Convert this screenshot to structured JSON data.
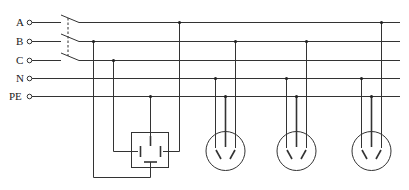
{
  "diagram": {
    "lines": [
      {
        "label": "A",
        "y": 22
      },
      {
        "label": "B",
        "y": 41
      },
      {
        "label": "C",
        "y": 60
      },
      {
        "label": "N",
        "y": 78
      },
      {
        "label": "PE",
        "y": 96
      }
    ],
    "colors": {
      "line": "#333333",
      "background": "#ffffff"
    },
    "components": {
      "switch": "three-pole-switch",
      "three_phase_socket": "four-hole-socket",
      "single_phase_sockets": 3
    },
    "caption": ""
  }
}
